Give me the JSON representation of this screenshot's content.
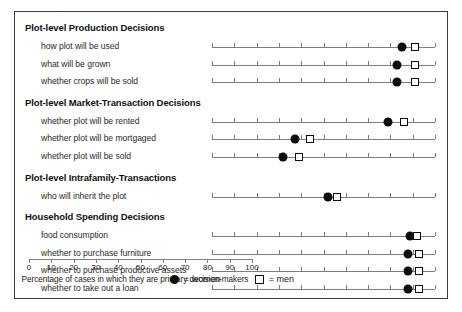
{
  "chart_data": {
    "type": "scatter",
    "title": "",
    "xlabel": "Percentage of cases in which they are primary decision-makers",
    "ylabel": "",
    "xlim": [
      0,
      100
    ],
    "xticks": [
      0,
      10,
      20,
      30,
      40,
      50,
      60,
      70,
      80,
      90,
      100
    ],
    "grid": false,
    "legend_position": "bottom-center",
    "series": [
      {
        "name": "women",
        "marker": "filled-circle",
        "color": "#0d0d0d"
      },
      {
        "name": "men",
        "marker": "open-square",
        "color": "#0d0d0d"
      }
    ],
    "sections": [
      {
        "header": "Plot-level Production Decisions",
        "rows": [
          {
            "label": "how plot will be used",
            "women": 85,
            "men": 91
          },
          {
            "label": "what will be grown",
            "women": 83,
            "men": 91
          },
          {
            "label": "whether crops will be sold",
            "women": 83,
            "men": 91
          }
        ]
      },
      {
        "header": "Plot-level Market-Transaction Decisions",
        "rows": [
          {
            "label": "whether plot will be rented",
            "women": 79,
            "men": 86
          },
          {
            "label": "whether plot will be mortgaged",
            "women": 37,
            "men": 44
          },
          {
            "label": "whether plot will be sold",
            "women": 32,
            "men": 39
          }
        ]
      },
      {
        "header": "Plot-level Intrafamily-Transactions",
        "rows": [
          {
            "label": "who will inherit the plot",
            "women": 52,
            "men": 56
          }
        ]
      },
      {
        "header": "Household Spending Decisions",
        "rows": [
          {
            "label": "food consumption",
            "women": 89,
            "men": 92
          },
          {
            "label": "whether to purchase furniture",
            "women": 88,
            "men": 93
          },
          {
            "label": "whether to purchase productive assets",
            "women": 88,
            "men": 93
          },
          {
            "label": "whether to take out a loan",
            "women": 88,
            "men": 93
          }
        ]
      }
    ]
  },
  "legend": {
    "items": [
      {
        "symbol": "filled-circle-icon",
        "text": "= women"
      },
      {
        "symbol": "open-square-icon",
        "text": "= men"
      }
    ]
  }
}
